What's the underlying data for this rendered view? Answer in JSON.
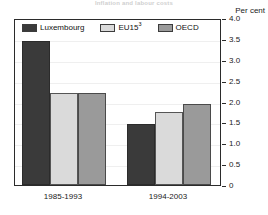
{
  "figure": {
    "title_strip": "Inflation and labour costs",
    "unit_label": "Per cent"
  },
  "chart_data": {
    "type": "bar",
    "title": "",
    "subtitle": "",
    "xlabel": "",
    "ylabel": "Per cent",
    "categories": [
      "1985-1993",
      "1994-2003"
    ],
    "series": [
      {
        "name": "Luxembourg",
        "color": "#3a3a3a",
        "values": [
          3.45,
          1.45
        ]
      },
      {
        "name": "EU15",
        "footnote": "3",
        "color": "#dadada",
        "values": [
          2.2,
          1.75
        ]
      },
      {
        "name": "OECD",
        "color": "#9a9a9a",
        "values": [
          2.2,
          1.95
        ]
      }
    ],
    "ylim": [
      0,
      4.0
    ],
    "ytick_values": [
      4.0,
      3.5,
      3.0,
      2.5,
      2.0,
      1.5,
      1.0,
      0.5,
      0
    ],
    "ytick_labels": [
      "4.0",
      "3.5",
      "3.0",
      "2.5",
      "2.0",
      "1.5",
      "1.0",
      "0.5",
      "0"
    ],
    "grid": true,
    "legend_position": "top-inside",
    "legend_entries": [
      "Luxembourg",
      "EU15",
      "OECD"
    ]
  }
}
